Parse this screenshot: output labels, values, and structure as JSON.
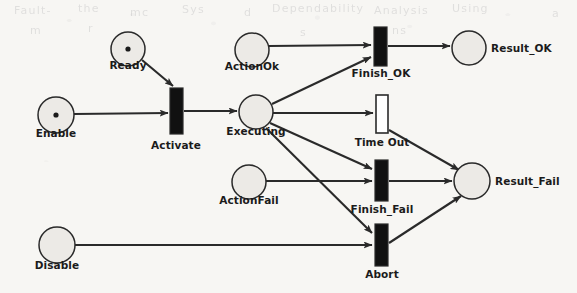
{
  "figure": {
    "type": "petri-net",
    "title": "",
    "background_color": "#f7f6f3",
    "stroke_color": "#2a2a2a",
    "place_fill": "#eceae6",
    "transition_fill_immediate": "#111111",
    "transition_fill_timed": "#ffffff"
  },
  "places": [
    {
      "id": "ready",
      "label": "Ready",
      "cx": 128,
      "cy": 49,
      "r": 17,
      "tokens": 1,
      "label_x": 128,
      "label_y": 70,
      "label_align": "center"
    },
    {
      "id": "enable",
      "label": "Enable",
      "cx": 56,
      "cy": 115,
      "r": 18,
      "tokens": 1,
      "label_x": 56,
      "label_y": 138,
      "label_align": "center"
    },
    {
      "id": "action_ok",
      "label": "ActionOk",
      "cx": 252,
      "cy": 50,
      "r": 17,
      "tokens": 0,
      "label_x": 252,
      "label_y": 71,
      "label_align": "center"
    },
    {
      "id": "executing",
      "label": "Executing",
      "cx": 256,
      "cy": 112,
      "r": 17,
      "tokens": 0,
      "label_x": 256,
      "label_y": 136,
      "label_align": "center"
    },
    {
      "id": "action_fail",
      "label": "ActionFail",
      "cx": 249,
      "cy": 182,
      "r": 17,
      "tokens": 0,
      "label_x": 249,
      "label_y": 205,
      "label_align": "center"
    },
    {
      "id": "disable",
      "label": "Disable",
      "cx": 57,
      "cy": 245,
      "r": 18,
      "tokens": 0,
      "label_x": 57,
      "label_y": 270,
      "label_align": "center"
    },
    {
      "id": "result_ok",
      "label": "Result_OK",
      "cx": 469,
      "cy": 48,
      "r": 17,
      "tokens": 0,
      "label_x": 491,
      "label_y": 53,
      "label_align": "left"
    },
    {
      "id": "result_fail",
      "label": "Result_Fail",
      "cx": 472,
      "cy": 181,
      "r": 18,
      "tokens": 0,
      "label_x": 495,
      "label_y": 186,
      "label_align": "left"
    }
  ],
  "transitions": [
    {
      "id": "activate",
      "label": "Activate",
      "x": 170,
      "y": 88,
      "w": 13,
      "h": 46,
      "kind": "immediate",
      "label_x": 176,
      "label_y": 150,
      "label_align": "center"
    },
    {
      "id": "finish_ok",
      "label": "Finish_OK",
      "x": 374,
      "y": 27,
      "w": 13,
      "h": 39,
      "kind": "immediate",
      "label_x": 381,
      "label_y": 78,
      "label_align": "center"
    },
    {
      "id": "time_out",
      "label": "Time Out",
      "x": 376,
      "y": 95,
      "w": 12,
      "h": 38,
      "kind": "timed",
      "label_x": 382,
      "label_y": 147,
      "label_align": "center"
    },
    {
      "id": "finish_fail",
      "label": "Finish_Fail",
      "x": 375,
      "y": 160,
      "w": 13,
      "h": 41,
      "kind": "immediate",
      "label_x": 382,
      "label_y": 214,
      "label_align": "center"
    },
    {
      "id": "abort",
      "label": "Abort",
      "x": 375,
      "y": 224,
      "w": 13,
      "h": 42,
      "kind": "immediate",
      "label_x": 382,
      "label_y": 279,
      "label_align": "center"
    }
  ],
  "arcs": [
    {
      "id": "ready-activate",
      "from": "ready",
      "to": "activate",
      "x1": 142,
      "y1": 60,
      "x2": 173,
      "y2": 86
    },
    {
      "id": "enable-activate",
      "from": "enable",
      "to": "activate",
      "x1": 74,
      "y1": 114,
      "x2": 168,
      "y2": 113
    },
    {
      "id": "activate-executing",
      "from": "activate",
      "to": "executing",
      "x1": 184,
      "y1": 111,
      "x2": 237,
      "y2": 111
    },
    {
      "id": "actionok-finishok",
      "from": "action_ok",
      "to": "finish_ok",
      "x1": 269,
      "y1": 46,
      "x2": 371,
      "y2": 45
    },
    {
      "id": "executing-finishok",
      "from": "executing",
      "to": "finish_ok",
      "x1": 272,
      "y1": 104,
      "x2": 371,
      "y2": 57
    },
    {
      "id": "executing-timeout",
      "from": "executing",
      "to": "time_out",
      "x1": 273,
      "y1": 113,
      "x2": 373,
      "y2": 113
    },
    {
      "id": "executing-finishfail",
      "from": "executing",
      "to": "finish_fail",
      "x1": 270,
      "y1": 123,
      "x2": 372,
      "y2": 169
    },
    {
      "id": "executing-abort",
      "from": "executing",
      "to": "abort",
      "x1": 266,
      "y1": 128,
      "x2": 372,
      "y2": 233
    },
    {
      "id": "actionfail-finishfail",
      "from": "action_fail",
      "to": "finish_fail",
      "x1": 266,
      "y1": 181,
      "x2": 372,
      "y2": 181
    },
    {
      "id": "disable-abort",
      "from": "disable",
      "to": "abort",
      "x1": 75,
      "y1": 245,
      "x2": 372,
      "y2": 245
    },
    {
      "id": "finishok-resultok",
      "from": "finish_ok",
      "to": "result_ok",
      "x1": 388,
      "y1": 46,
      "x2": 450,
      "y2": 46
    },
    {
      "id": "timeout-resultfail",
      "from": "time_out",
      "to": "result_fail",
      "x1": 389,
      "y1": 130,
      "x2": 459,
      "y2": 170
    },
    {
      "id": "finishfail-resultfail",
      "from": "finish_fail",
      "to": "result_fail",
      "x1": 389,
      "y1": 181,
      "x2": 452,
      "y2": 181
    },
    {
      "id": "abort-resultfail",
      "from": "abort",
      "to": "result_fail",
      "x1": 389,
      "y1": 243,
      "x2": 461,
      "y2": 196
    }
  ],
  "bleed_text": [
    {
      "text": "Fault-",
      "x": 14,
      "y": 4
    },
    {
      "text": "the",
      "x": 78,
      "y": 2
    },
    {
      "text": "mc",
      "x": 130,
      "y": 6
    },
    {
      "text": "Sys",
      "x": 182,
      "y": 3
    },
    {
      "text": "d",
      "x": 244,
      "y": 6
    },
    {
      "text": "Dependability",
      "x": 272,
      "y": 2
    },
    {
      "text": "Analysis",
      "x": 374,
      "y": 4
    },
    {
      "text": "Using",
      "x": 452,
      "y": 2
    },
    {
      "text": "a",
      "x": 552,
      "y": 7
    },
    {
      "text": "m",
      "x": 30,
      "y": 24
    },
    {
      "text": "r",
      "x": 88,
      "y": 22
    },
    {
      "text": "s",
      "x": 300,
      "y": 26
    },
    {
      "text": "ns",
      "x": 392,
      "y": 24
    }
  ]
}
